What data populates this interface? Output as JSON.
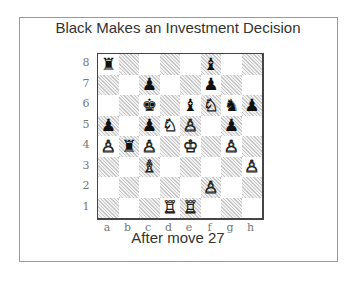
{
  "title": "Black Makes an Investment Decision",
  "caption": "After move 27",
  "files": [
    "a",
    "b",
    "c",
    "d",
    "e",
    "f",
    "g",
    "h"
  ],
  "ranks": [
    "8",
    "7",
    "6",
    "5",
    "4",
    "3",
    "2",
    "1"
  ],
  "board": [
    [
      "bR",
      "",
      "",
      "",
      "",
      "bB",
      "",
      ""
    ],
    [
      "",
      "",
      "bP",
      "",
      "",
      "bP",
      "",
      ""
    ],
    [
      "",
      "",
      "bK",
      "",
      "bB",
      "wN",
      "bN",
      "bP"
    ],
    [
      "bP",
      "",
      "bP",
      "wN",
      "wP",
      "",
      "bP",
      ""
    ],
    [
      "wP",
      "bR",
      "wP",
      "",
      "wK",
      "",
      "wP",
      ""
    ],
    [
      "",
      "",
      "wB",
      "",
      "",
      "",
      "",
      "wP"
    ],
    [
      "",
      "",
      "",
      "",
      "",
      "wP",
      "",
      ""
    ],
    [
      "",
      "",
      "",
      "wR",
      "wR",
      "",
      "",
      ""
    ]
  ],
  "glyphs": {
    "wK": "♔",
    "wQ": "♕",
    "wR": "♖",
    "wB": "♗",
    "wN": "♘",
    "wP": "♙",
    "bK": "♚",
    "bQ": "♛",
    "bR": "♜",
    "bB": "♝",
    "bN": "♞",
    "bP": "♟"
  },
  "piece_names": {
    "wK": "white-king",
    "wQ": "white-queen",
    "wR": "white-rook",
    "wB": "white-bishop",
    "wN": "white-knight",
    "wP": "white-pawn",
    "bK": "black-king",
    "bQ": "black-queen",
    "bR": "black-rook",
    "bB": "black-bishop",
    "bN": "black-knight",
    "bP": "black-pawn"
  }
}
